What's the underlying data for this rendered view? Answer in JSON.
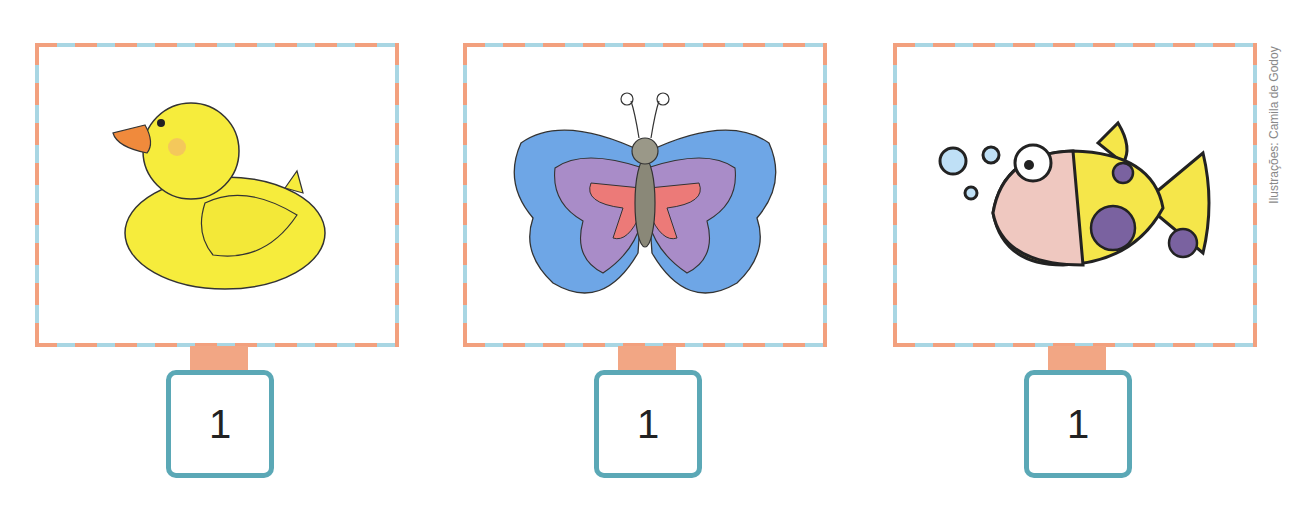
{
  "cards": [
    {
      "animal": "duck",
      "number": "1"
    },
    {
      "animal": "butterfly",
      "number": "1"
    },
    {
      "animal": "fish",
      "number": "1"
    }
  ],
  "credit": "Ilustrações: Camila de Godoy",
  "colors": {
    "frame_dash_a": "#f2a07e",
    "frame_dash_b": "#a9d6e3",
    "tab": "#f2a684",
    "number_box_border": "#5ba8b6"
  }
}
